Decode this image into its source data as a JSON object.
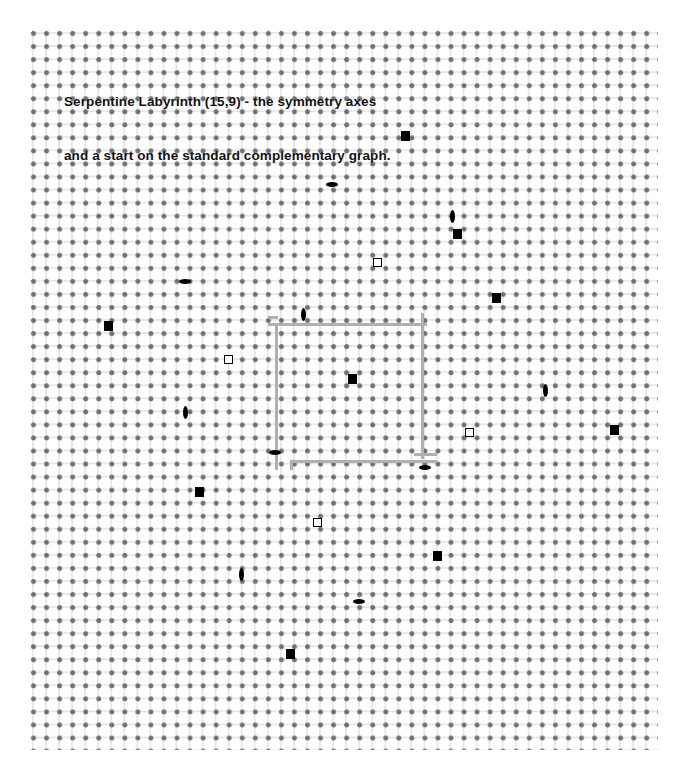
{
  "figure": {
    "title_line1": "Serpentine Labyrinth (15,9) - the symmetry axes",
    "title_line2": "and a start on the standard complementary graph.",
    "background_color": "#ffffff",
    "dot_color": "#707070",
    "grid_line_color": "#c8c8c8",
    "axes_color": "#b0b0b0",
    "marker_color": "#000000"
  },
  "lattice": {
    "origin_x": 33,
    "origin_y": 33,
    "spacing": 13.05,
    "cols": 48,
    "rows": 55
  },
  "chart_data": {
    "type": "scatter",
    "title": "Serpentine Labyrinth (15,9) - the symmetry axes and a start on the standard complementary graph.",
    "xlabel": "",
    "ylabel": "",
    "grid": true,
    "legend": "none",
    "background_lattice": {
      "description": "square dot lattice",
      "spacing_px": 13.05,
      "cols": 48,
      "rows": 55
    },
    "series": [
      {
        "name": "filled-square",
        "marker": "filled square",
        "points": [
          {
            "x": 405,
            "y": 136
          },
          {
            "x": 457,
            "y": 234
          },
          {
            "x": 496,
            "y": 298
          },
          {
            "x": 108,
            "y": 326
          },
          {
            "x": 352,
            "y": 379
          },
          {
            "x": 614,
            "y": 430
          },
          {
            "x": 199,
            "y": 492
          },
          {
            "x": 437,
            "y": 556
          },
          {
            "x": 290,
            "y": 654
          }
        ]
      },
      {
        "name": "open-square",
        "marker": "open square",
        "points": [
          {
            "x": 377,
            "y": 262
          },
          {
            "x": 228,
            "y": 359
          },
          {
            "x": 469,
            "y": 432
          },
          {
            "x": 317,
            "y": 522
          }
        ]
      },
      {
        "name": "horizontal-lens",
        "marker": "horizontal lens",
        "points": [
          {
            "x": 332,
            "y": 184
          },
          {
            "x": 185,
            "y": 281
          },
          {
            "x": 275,
            "y": 452
          },
          {
            "x": 425,
            "y": 467
          },
          {
            "x": 359,
            "y": 601
          }
        ]
      },
      {
        "name": "vertical-lens",
        "marker": "vertical lens",
        "points": [
          {
            "x": 452,
            "y": 216
          },
          {
            "x": 303,
            "y": 314
          },
          {
            "x": 545,
            "y": 390
          },
          {
            "x": 185,
            "y": 412
          },
          {
            "x": 241,
            "y": 574
          }
        ]
      }
    ],
    "axes_polyline": {
      "description": "Gray stepped rectangle marking the symmetry axes of the labyrinth",
      "segments": [
        {
          "orient": "h",
          "x1": 268,
          "x2": 424,
          "y": 323
        },
        {
          "orient": "v",
          "x": 275,
          "y1": 323,
          "y2": 467
        },
        {
          "orient": "v",
          "x": 421,
          "y1": 313,
          "y2": 456
        },
        {
          "orient": "h",
          "x1": 268,
          "x2": 275,
          "y": 316
        },
        {
          "orient": "h",
          "x1": 290,
          "x2": 434,
          "y": 460
        },
        {
          "orient": "v",
          "x": 290,
          "y1": 460,
          "y2": 467
        },
        {
          "orient": "h",
          "x1": 414,
          "x2": 434,
          "y": 453
        }
      ]
    }
  }
}
